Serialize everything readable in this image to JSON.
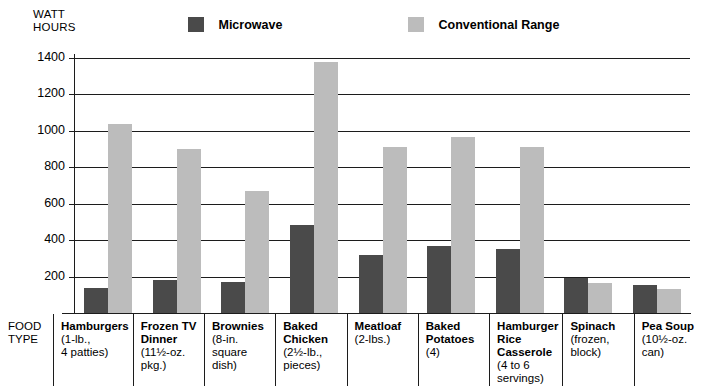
{
  "chart_data": {
    "type": "bar",
    "title": "",
    "ylabel": "WATT HOURS",
    "xlabel": "FOOD TYPE",
    "ylim": [
      0,
      1400
    ],
    "yticks": [
      200,
      400,
      600,
      800,
      1000,
      1200,
      1400
    ],
    "grid": true,
    "legend_position": "top",
    "categories": [
      "Hamburgers",
      "Frozen TV Dinner",
      "Brownies",
      "Baked Chicken",
      "Meatloaf",
      "Baked Potatoes",
      "Hamburger Rice Casserole",
      "Spinach",
      "Pea Soup"
    ],
    "category_details": [
      "(1-lb.,\n4 patties)",
      "(11½-oz.\npkg.)",
      "(8-in.\nsquare\ndish)",
      "(2½-lb.,\npieces)",
      "(2-lbs.)",
      "(4)",
      "(4 to 6\nservings)",
      "(frozen,\nblock)",
      "(10½-oz.\ncan)"
    ],
    "series": [
      {
        "name": "Microwave",
        "color": "#4a4a4a",
        "values": [
          140,
          180,
          170,
          485,
          320,
          370,
          350,
          190,
          155
        ]
      },
      {
        "name": "Conventional Range",
        "color": "#bcbcbc",
        "values": [
          1040,
          900,
          670,
          1380,
          910,
          965,
          910,
          165,
          130
        ]
      }
    ]
  },
  "axis": {
    "y_title": "WATT\nHOURS",
    "x_title": "FOOD\nTYPE"
  },
  "legend": {
    "microwave_label": "Microwave",
    "conventional_label": "Conventional Range"
  },
  "colors": {
    "microwave": "#4a4a4a",
    "conventional": "#bcbcbc",
    "line": "#1c1c1c",
    "background": "#ffffff"
  }
}
